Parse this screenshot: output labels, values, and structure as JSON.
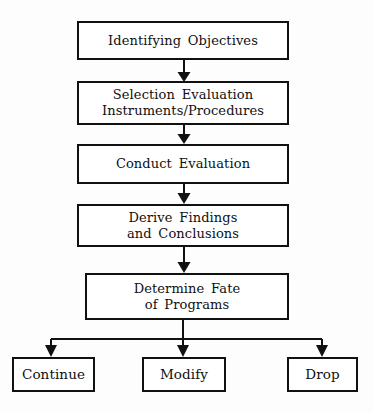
{
  "diagram": {
    "orientation": "top-to-bottom",
    "background_color": "#fdfdfd",
    "line_color": "#111111",
    "box_fill_color": "#ffffff",
    "nodes": [
      {
        "id": "n1",
        "label": "Identifying Objectives",
        "shape": "rectangle",
        "role": "process"
      },
      {
        "id": "n2",
        "label": "Selection Evaluation\nInstruments/Procedures",
        "shape": "rectangle",
        "role": "process"
      },
      {
        "id": "n3",
        "label": "Conduct Evaluation",
        "shape": "rectangle",
        "role": "process"
      },
      {
        "id": "n4",
        "label": "Derive Findings\nand Conclusions",
        "shape": "rectangle",
        "role": "process"
      },
      {
        "id": "n5",
        "label": "Determine Fate\nof Programs",
        "shape": "rectangle",
        "role": "decision-process"
      },
      {
        "id": "t1",
        "label": "Continue",
        "shape": "rectangle",
        "role": "terminal-outcome"
      },
      {
        "id": "t2",
        "label": "Modify",
        "shape": "rectangle",
        "role": "terminal-outcome"
      },
      {
        "id": "t3",
        "label": "Drop",
        "shape": "rectangle",
        "role": "terminal-outcome"
      }
    ],
    "edges": [
      {
        "from": "n1",
        "to": "n2",
        "style": "arrow-down"
      },
      {
        "from": "n2",
        "to": "n3",
        "style": "arrow-down"
      },
      {
        "from": "n3",
        "to": "n4",
        "style": "arrow-down"
      },
      {
        "from": "n4",
        "to": "n5",
        "style": "arrow-down"
      },
      {
        "from": "n5",
        "to": "t1",
        "style": "split-branch-arrow"
      },
      {
        "from": "n5",
        "to": "t2",
        "style": "split-branch-arrow"
      },
      {
        "from": "n5",
        "to": "t3",
        "style": "split-branch-arrow"
      }
    ]
  }
}
